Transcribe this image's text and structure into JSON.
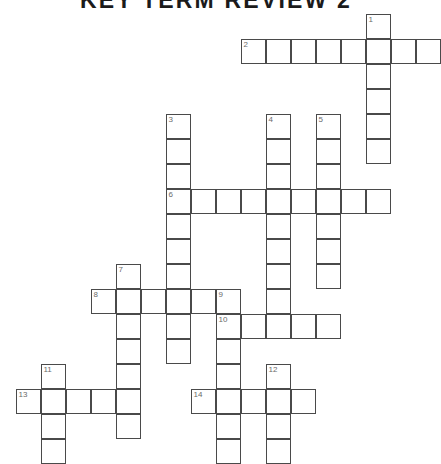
{
  "title": "KEY TERM REVIEW 2",
  "puzzle": {
    "type": "crossword",
    "cell_size_px": 25,
    "origin": {
      "x": 16,
      "y": 14
    },
    "grid_cols": 17,
    "grid_rows": 18,
    "border_color": "#4a4a4a",
    "number_color": "#6a6a6a",
    "cell_fill": "#ffffff",
    "entries": [
      {
        "number": "1",
        "direction": "down",
        "row": 0,
        "col": 14,
        "length": 6
      },
      {
        "number": "2",
        "direction": "across",
        "row": 1,
        "col": 9,
        "length": 8
      },
      {
        "number": "3",
        "direction": "down",
        "row": 4,
        "col": 6,
        "length": 10
      },
      {
        "number": "4",
        "direction": "down",
        "row": 4,
        "col": 10,
        "length": 8
      },
      {
        "number": "5",
        "direction": "down",
        "row": 4,
        "col": 12,
        "length": 7
      },
      {
        "number": "6",
        "direction": "across",
        "row": 7,
        "col": 6,
        "length": 9
      },
      {
        "number": "7",
        "direction": "down",
        "row": 10,
        "col": 4,
        "length": 7
      },
      {
        "number": "8",
        "direction": "across",
        "row": 11,
        "col": 3,
        "length": 6
      },
      {
        "number": "9",
        "direction": "down",
        "row": 11,
        "col": 8,
        "length": 7
      },
      {
        "number": "10",
        "direction": "across",
        "row": 12,
        "col": 8,
        "length": 5
      },
      {
        "number": "11",
        "direction": "down",
        "row": 14,
        "col": 1,
        "length": 4
      },
      {
        "number": "12",
        "direction": "down",
        "row": 14,
        "col": 10,
        "length": 4
      },
      {
        "number": "13",
        "direction": "across",
        "row": 15,
        "col": 0,
        "length": 5
      },
      {
        "number": "14",
        "direction": "across",
        "row": 15,
        "col": 7,
        "length": 5
      }
    ],
    "letters": []
  }
}
